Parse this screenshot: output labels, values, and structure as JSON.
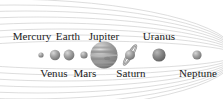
{
  "diagram": {
    "background_color": "#ffffff",
    "line_color": "#cfcfcf",
    "text_color": "#1a1a1a",
    "width": 223,
    "height": 99
  },
  "planets": [
    {
      "name": "Mercury",
      "label": "Mercury",
      "label_position": "above",
      "cx": 41,
      "cy": 55,
      "r": 2.6,
      "label_x": 32,
      "label_y": 31,
      "color": "#8d8d8d",
      "highlight": "#bdbdbd"
    },
    {
      "name": "Venus",
      "label": "Venus",
      "label_position": "below",
      "cx": 55,
      "cy": 55,
      "r": 5.2,
      "label_x": 54,
      "label_y": 68,
      "color": "#8a8a8a",
      "highlight": "#c4c4c4"
    },
    {
      "name": "Earth",
      "label": "Earth",
      "label_position": "above",
      "cx": 69,
      "cy": 55,
      "r": 5.4,
      "label_x": 68,
      "label_y": 31,
      "color": "#868686",
      "highlight": "#c0c0c0"
    },
    {
      "name": "Mars",
      "label": "Mars",
      "label_position": "below",
      "cx": 84,
      "cy": 55,
      "r": 3.6,
      "label_x": 85,
      "label_y": 68,
      "color": "#8b8b8b",
      "highlight": "#bfbfbf"
    },
    {
      "name": "Jupiter",
      "label": "Jupiter",
      "label_position": "above",
      "cx": 104,
      "cy": 55,
      "r": 13.5,
      "label_x": 104,
      "label_y": 31,
      "color": "#8f8f8f",
      "highlight": "#c9c9c9"
    },
    {
      "name": "Saturn",
      "label": "Saturn",
      "label_position": "below",
      "cx": 130,
      "cy": 55,
      "r": 5.0,
      "label_x": 131,
      "label_y": 68,
      "color": "#909090",
      "highlight": "#c8c8c8",
      "has_rings": true,
      "ring_tilt": -58
    },
    {
      "name": "Uranus",
      "label": "Uranus",
      "label_position": "above",
      "cx": 159,
      "cy": 55,
      "r": 6.6,
      "label_x": 159,
      "label_y": 31,
      "color": "#7c7c7c",
      "highlight": "#b4b4b4"
    },
    {
      "name": "Neptune",
      "label": "Neptune",
      "label_position": "below",
      "cx": 197,
      "cy": 55,
      "r": 4.6,
      "label_x": 198,
      "label_y": 68,
      "color": "#8a8a8a",
      "highlight": "#bcbcbc"
    }
  ],
  "orbits": [
    {
      "id": "orbit-1",
      "rx": 150,
      "ry": 14
    },
    {
      "id": "orbit-2",
      "rx": 162,
      "ry": 20
    },
    {
      "id": "orbit-3",
      "rx": 174,
      "ry": 26
    },
    {
      "id": "orbit-4",
      "rx": 186,
      "ry": 32
    },
    {
      "id": "orbit-5",
      "rx": 198,
      "ry": 38
    },
    {
      "id": "orbit-6",
      "rx": 210,
      "ry": 44
    },
    {
      "id": "orbit-7",
      "rx": 222,
      "ry": 50
    },
    {
      "id": "orbit-8",
      "rx": 234,
      "ry": 56
    }
  ]
}
